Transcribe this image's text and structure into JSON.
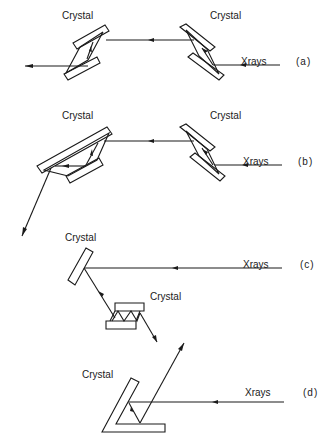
{
  "panels": [
    {
      "id": "a",
      "tag": "(a)",
      "beam_label": "Xrays",
      "crystal_labels": [
        "Crystal",
        "Crystal"
      ],
      "description": "Two channel-cut crystals in antiparallel arrangement; beam exits to the left"
    },
    {
      "id": "b",
      "tag": "(b)",
      "beam_label": "Xrays",
      "crystal_labels": [
        "Crystal",
        "Crystal"
      ],
      "description": "Channel-cut crystal followed by asymmetric channel-cut crystal; beam exits downward-left"
    },
    {
      "id": "c",
      "tag": "(c)",
      "beam_label": "Xrays",
      "crystal_labels": [
        "Crystal",
        "Crystal"
      ],
      "description": "Single flat crystal reflects beam down to a multiple-bounce channel-cut crystal"
    },
    {
      "id": "d",
      "tag": "(d)",
      "beam_label": "Xrays",
      "crystal_labels": [
        "Crystal"
      ],
      "description": "L-shaped (two-surface) crystal; beam exits upward-right"
    }
  ]
}
